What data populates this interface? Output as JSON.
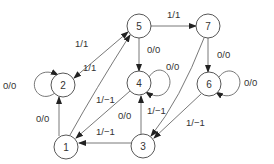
{
  "diagram": {
    "type": "directed-graph",
    "nodes": [
      {
        "id": "1",
        "label": "1"
      },
      {
        "id": "2",
        "label": "2"
      },
      {
        "id": "3",
        "label": "3"
      },
      {
        "id": "4",
        "label": "4"
      },
      {
        "id": "5",
        "label": "5"
      },
      {
        "id": "6",
        "label": "6"
      },
      {
        "id": "7",
        "label": "7"
      }
    ],
    "edges": [
      {
        "from": "2",
        "to": "5",
        "label": "1/1",
        "dir": "both"
      },
      {
        "from": "1",
        "to": "5",
        "label": "1/1"
      },
      {
        "from": "5",
        "to": "7",
        "label": "1/1"
      },
      {
        "from": "5",
        "to": "4",
        "label": "0/0"
      },
      {
        "from": "4",
        "to": "4",
        "label": "0/0"
      },
      {
        "from": "7",
        "to": "6",
        "label": "0/0"
      },
      {
        "from": "6",
        "to": "6",
        "label": "0/0"
      },
      {
        "from": "2",
        "to": "2",
        "label": "0/0"
      },
      {
        "from": "1",
        "to": "2",
        "label": "0/0"
      },
      {
        "from": "4",
        "to": "1",
        "label": "1/−1"
      },
      {
        "from": "3",
        "to": "4",
        "label": "1/−1"
      },
      {
        "from": "3",
        "to": "1",
        "label": "1/−1"
      },
      {
        "from": "6",
        "to": "3",
        "label": "1/−1"
      },
      {
        "from": "7",
        "to": "3",
        "label": "0/0"
      }
    ]
  }
}
